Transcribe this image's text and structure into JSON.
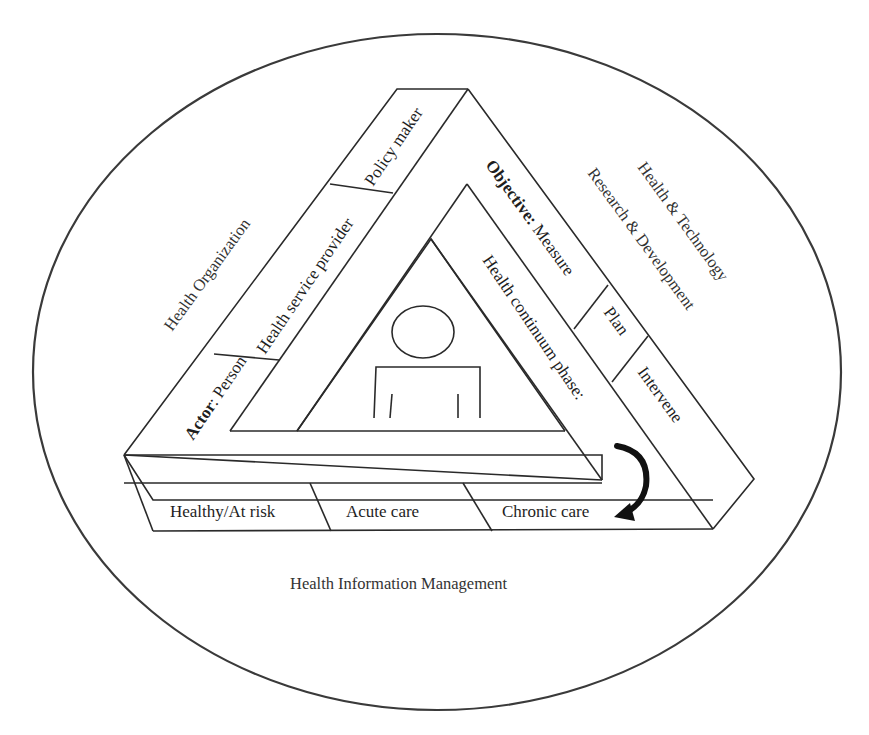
{
  "diagram": {
    "outer_labels": {
      "top_left": "Health Organization",
      "top_right_line1": "Health & Technology",
      "top_right_line2": "Research & Development",
      "bottom": "Health Information Management"
    },
    "actor_band": {
      "prefix": "Actor",
      "separator": ": ",
      "segments": [
        "Person",
        "Health service provider",
        "Policy maker"
      ]
    },
    "objective_band": {
      "prefix": "Objective:",
      "segments": [
        "Measure",
        "Plan",
        "Intervene"
      ]
    },
    "health_continuum_band": {
      "label": "Health continuum phase:",
      "segments": [
        "Healthy/At risk",
        "Acute care",
        "Chronic care"
      ]
    },
    "center_icon": "person-icon",
    "cycle_arrow_icon": "curved-arrow-icon",
    "colors": {
      "line": "#2a2a2a",
      "text": "#1e1e1e",
      "background": "#ffffff"
    }
  }
}
